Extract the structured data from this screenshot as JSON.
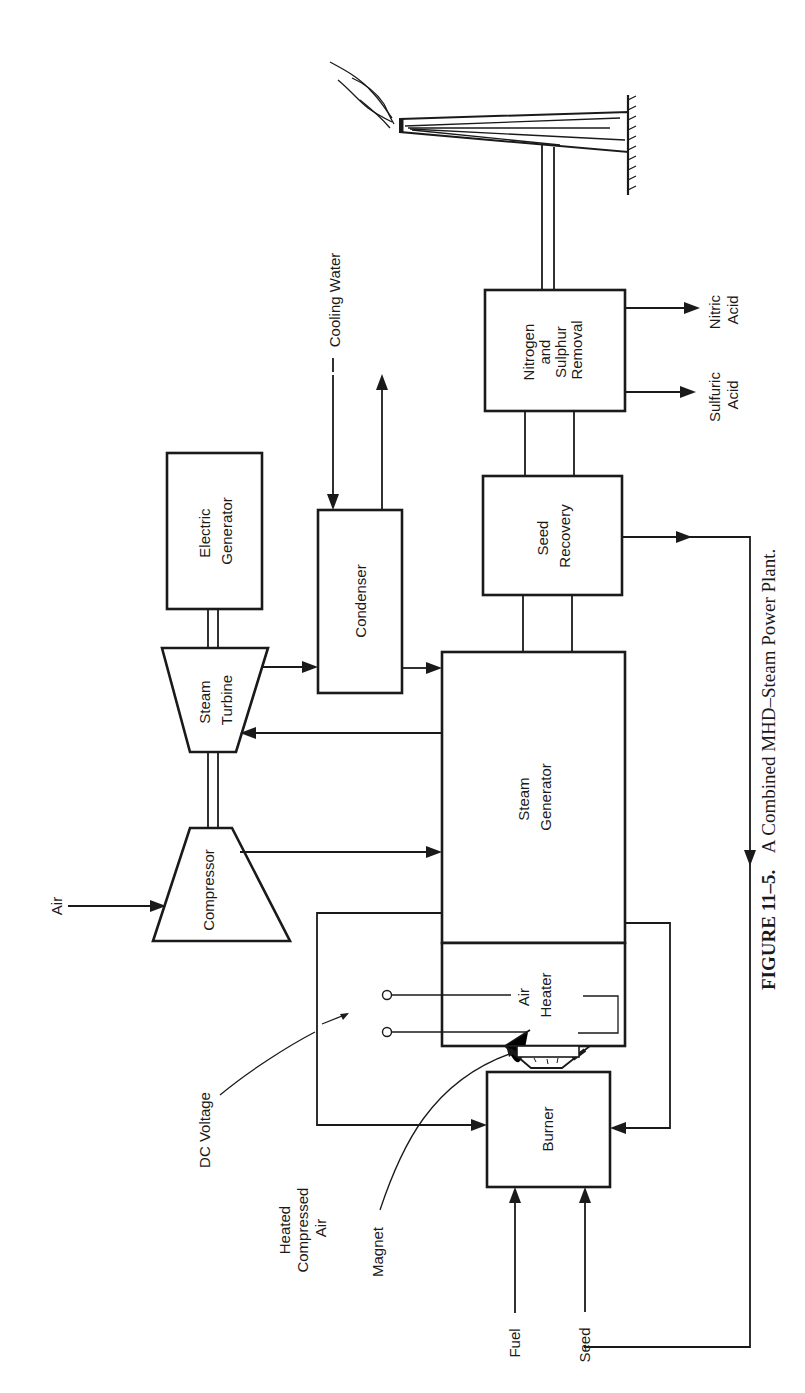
{
  "figure": {
    "caption_number": "FIGURE 11–5.",
    "caption_text": "A Combined MHD–Steam Power Plant.",
    "orientation": "rotated 90° counter-clockwise"
  },
  "components": {
    "electric_generator": [
      "Electric",
      "Generator"
    ],
    "steam_turbine": [
      "Steam",
      "Turbine"
    ],
    "compressor": [
      "Compressor"
    ],
    "condenser": [
      "Condenser"
    ],
    "steam_generator": [
      "Steam",
      "Generator"
    ],
    "air_heater": [
      "Air",
      "Heater"
    ],
    "seed_recovery": [
      "Seed",
      "Recovery"
    ],
    "nitrogen_sulphur_removal": [
      "Nitrogen",
      "and",
      "Sulphur",
      "Removal"
    ],
    "burner": [
      "Burner"
    ]
  },
  "labels": {
    "cooling_water": "Cooling Water",
    "air": "Air",
    "dc_voltage": "DC Voltage",
    "heated_compressed_air": [
      "Heated",
      "Compressed",
      "Air"
    ],
    "magnet": "Magnet",
    "fuel": "Fuel",
    "seed": "Seed",
    "nitric_acid": [
      "Nitric",
      "Acid"
    ],
    "sulfuric_acid": [
      "Sulfuric",
      "Acid"
    ]
  },
  "colors": {
    "ink": "#1a1a1a",
    "paper": "#ffffff"
  }
}
